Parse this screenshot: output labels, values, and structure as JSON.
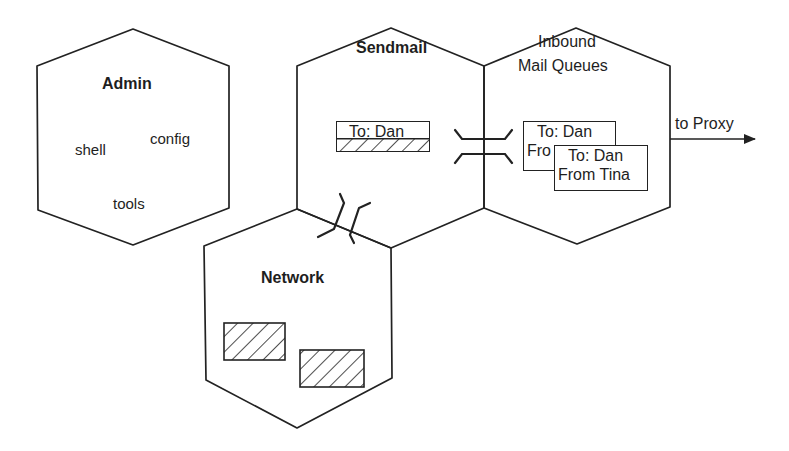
{
  "diagram": {
    "hexagons": [
      {
        "id": "admin",
        "title": "Admin",
        "items": [
          "shell",
          "config",
          "tools"
        ]
      },
      {
        "id": "sendmail",
        "title": "Sendmail",
        "message": {
          "to": "To: Dan",
          "from_partial": "From Tina"
        }
      },
      {
        "id": "inbound",
        "title_line1": "Inbound",
        "title_line2": "Mail Queues",
        "messages": [
          {
            "to": "To: Dan",
            "from_partial": "Fro"
          },
          {
            "to": "To: Dan",
            "from": "From Tina"
          }
        ]
      },
      {
        "id": "network",
        "title": "Network",
        "packets": 2
      }
    ],
    "arrow_label": "to Proxy",
    "colors": {
      "stroke": "#222222",
      "background": "#ffffff"
    }
  }
}
